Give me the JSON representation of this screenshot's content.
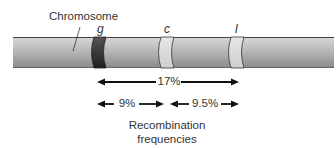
{
  "diagram": {
    "chromosome_label": "Chromosome",
    "genes": [
      {
        "name": "g",
        "band": "dark"
      },
      {
        "name": "c",
        "band": "light"
      },
      {
        "name": "l",
        "band": "light"
      }
    ],
    "distances": {
      "g_to_l": "17%",
      "g_to_c": "9%",
      "c_to_l": "9.5%"
    },
    "caption_line1": "Recombination",
    "caption_line2": "frequencies",
    "colors": {
      "chromosome_top": "#d6d6d6",
      "chromosome_bottom": "#8e8e8e",
      "band_dark": "#2e2e2e",
      "band_light": "#dcdcdc",
      "arrow": "#111111"
    }
  }
}
